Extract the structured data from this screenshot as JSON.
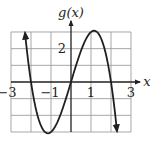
{
  "chart_data": {
    "type": "line",
    "title": "",
    "ylabel": "g(x)",
    "xlabel": "x",
    "function": "g(x) = 4x - x^3",
    "xlim": [
      -3,
      3
    ],
    "ylim": [
      -3,
      3
    ],
    "grid": true,
    "grid_step": {
      "x": 1,
      "y": 1
    },
    "x_tick_labels": [
      "-3",
      "-1",
      "1",
      "3"
    ],
    "x_tick_values": [
      -3,
      -1,
      1,
      3
    ],
    "y_tick_labels": [
      "2"
    ],
    "y_tick_values": [
      2
    ],
    "series": [
      {
        "name": "g(x)",
        "x": [
          -2.3,
          -2,
          -1.5,
          -1.155,
          -1,
          -0.5,
          0,
          0.5,
          1,
          1.155,
          1.5,
          2,
          2.3
        ],
        "y": [
          2.97,
          0,
          -2.63,
          -3.08,
          -3,
          -1.88,
          0,
          1.88,
          3,
          3.08,
          2.63,
          0,
          -2.97
        ],
        "arrows_at_ends": true
      }
    ],
    "key_points": {
      "roots": [
        -2,
        0,
        2
      ],
      "local_max": [
        1.15,
        3.08
      ],
      "local_min": [
        -1.15,
        -3.08
      ]
    }
  },
  "labels": {
    "y_axis": "g(x)",
    "x_axis": "x",
    "tick_neg3": "−3",
    "tick_neg1": "−1",
    "tick_1": "1",
    "tick_3": "3",
    "tick_y2": "2"
  },
  "colors": {
    "grid": "#9d9d9d",
    "axis": "#231f20",
    "curve": "#231f20",
    "background": "#ffffff"
  }
}
